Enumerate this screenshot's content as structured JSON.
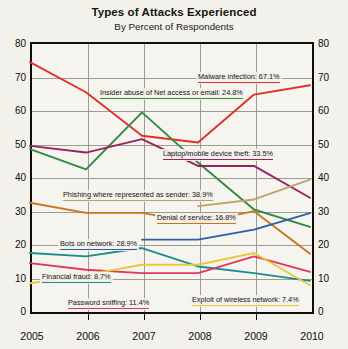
{
  "chart_data": {
    "type": "line",
    "title": "Types of Attacks Experienced",
    "subtitle": "By Percent of Respondents",
    "xlabel": "",
    "ylabel": "",
    "x": [
      2005,
      2006,
      2007,
      2008,
      2009,
      2010
    ],
    "xlim": [
      2005,
      2010
    ],
    "ylim": [
      0,
      80
    ],
    "yticks": [
      0,
      10,
      20,
      30,
      40,
      50,
      60,
      70,
      80
    ],
    "xticks": [
      "2005",
      "2006",
      "2007",
      "2008",
      "2009",
      "2010"
    ],
    "grid": true,
    "legend": "inline-annotations",
    "series": [
      {
        "name": "Malware infection",
        "label": "Malware infection: 67.1%",
        "final_value": 67.1,
        "color": "#e03127",
        "values": [
          74,
          65,
          52,
          50,
          64.3,
          67.1
        ]
      },
      {
        "name": "Insider abuse of Net access or email",
        "label": "Insider abuse of Net access or email: 24.8%",
        "final_value": 24.8,
        "color": "#2e8b3f",
        "values": [
          48,
          42,
          59,
          44,
          30,
          24.8
        ]
      },
      {
        "name": "Laptop/mobile device theft",
        "label": "Laptop/mobile device theft: 33.5%",
        "final_value": 33.5,
        "color": "#9c2060",
        "values": [
          49,
          47,
          51,
          43,
          43,
          33.5
        ]
      },
      {
        "name": "Phishing where represented as sender",
        "label": "Phishing where represented as sender: 38.9%",
        "final_value": 38.9,
        "color": "#bda26a",
        "values": [
          null,
          null,
          null,
          31,
          33,
          38.9
        ]
      },
      {
        "name": "Denial of service",
        "label": "Denial of service: 16.8%",
        "final_value": 16.8,
        "color": "#c7761d",
        "values": [
          32,
          29,
          29,
          26,
          29.5,
          16.8
        ]
      },
      {
        "name": "Bots on network",
        "label": "Bots on network: 28.9%",
        "final_value": 28.9,
        "color": "#2a5fa8",
        "values": [
          null,
          null,
          21,
          21,
          24,
          28.9
        ]
      },
      {
        "name": "Financial fraud",
        "label": "Financial fraud: 8.7%",
        "final_value": 8.7,
        "color": "#1c8d8d",
        "values": [
          17,
          16,
          18.5,
          13,
          11,
          8.7
        ]
      },
      {
        "name": "Password sniffing",
        "label": "Password sniffing: 11.4%",
        "final_value": 11.4,
        "color": "#e0365f",
        "values": [
          14,
          12,
          11,
          11,
          16,
          11.4
        ]
      },
      {
        "name": "Exploit of wireless network",
        "label": "Exploit of wireless network: 7.4%",
        "final_value": 7.4,
        "color": "#e8c83c",
        "values": [
          8,
          10.5,
          13.5,
          13.5,
          17,
          7.4
        ]
      }
    ]
  },
  "annotations": [
    {
      "key": "malware",
      "text": "Malware infection: 67.1%",
      "color": "#e03127",
      "x": 196,
      "y": 72
    },
    {
      "key": "insider",
      "text": "Insider abuse of Net access or email: 24.8%",
      "color": "#2e8b3f",
      "x": 98,
      "y": 88
    },
    {
      "key": "laptop",
      "text": "Laptop/mobile device theft: 33.5%",
      "color": "#9c2060",
      "x": 161,
      "y": 149
    },
    {
      "key": "phishing",
      "text": "Phishing where represented as sender: 38.9%",
      "color": "#bda26a",
      "x": 61,
      "y": 190
    },
    {
      "key": "dos",
      "text": "Denial of service: 16.8%",
      "color": "#c7761d",
      "x": 155,
      "y": 213
    },
    {
      "key": "bots",
      "text": "Bots on network: 28.9%",
      "color": "#2a5fa8",
      "x": 58,
      "y": 239
    },
    {
      "key": "fraud",
      "text": "Financial fraud: 8.7%",
      "color": "#1c8d8d",
      "x": 40,
      "y": 272
    },
    {
      "key": "password",
      "text": "Password sniffing: 11.4%",
      "color": "#e0365f",
      "x": 66,
      "y": 298
    },
    {
      "key": "wireless",
      "text": "Exploit of wireless network: 7.4%",
      "color": "#e8c83c",
      "x": 190,
      "y": 295
    }
  ]
}
